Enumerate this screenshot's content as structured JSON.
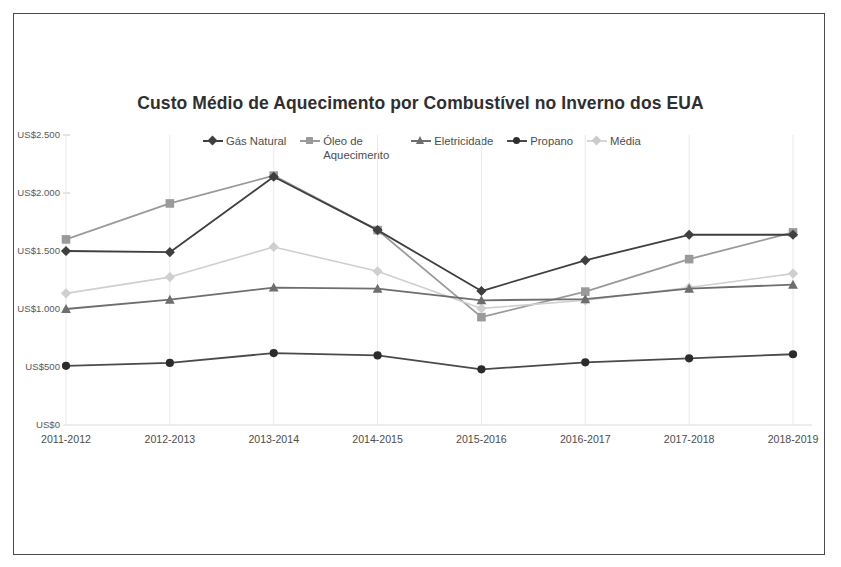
{
  "chart_data": {
    "type": "line",
    "title": "Custo Médio de Aquecimento por Combustível no Inverno dos EUA",
    "xlabel": "",
    "ylabel": "",
    "categories": [
      "2011-2012",
      "2012-2013",
      "2013-2014",
      "2014-2015",
      "2015-2016",
      "2016-2017",
      "2017-2018",
      "2018-2019"
    ],
    "ylim": [
      0,
      2500
    ],
    "ytick_values": [
      0,
      500,
      1000,
      1500,
      2000,
      2500
    ],
    "ytick_labels": [
      "US$0",
      "US$500",
      "US$1.000",
      "US$1.500",
      "US$2.000",
      "US$2.500"
    ],
    "grid": "vertical",
    "legend_position": "top",
    "series": [
      {
        "name": "Gás Natural",
        "marker": "diamond",
        "color": "#3f3f3f",
        "values": [
          1500,
          1490,
          2140,
          1680,
          1155,
          1420,
          1640,
          1640
        ]
      },
      {
        "name": "Óleo de Aquecimento",
        "marker": "square",
        "color": "#9a9a9a",
        "values": [
          1600,
          1910,
          2150,
          1680,
          930,
          1150,
          1430,
          1660
        ]
      },
      {
        "name": "Eletricidade",
        "marker": "triangle",
        "color": "#6e6e6e",
        "values": [
          1000,
          1080,
          1185,
          1175,
          1075,
          1085,
          1175,
          1210
        ]
      },
      {
        "name": "Propano",
        "marker": "circle",
        "color": "#4a4a4a",
        "values": [
          510,
          535,
          620,
          600,
          480,
          540,
          575,
          610
        ]
      },
      {
        "name": "Média",
        "marker": "diamond",
        "color": "#cfcfcf",
        "values": [
          1135,
          1275,
          1535,
          1325,
          1005,
          1075,
          1185,
          1305
        ]
      }
    ]
  },
  "chart": {
    "title": "Custo Médio de Aquecimento por Combustível no Inverno dos EUA",
    "legend": [
      {
        "label": "Gás Natural",
        "marker": "diamond-marker-icon",
        "color": "#3f3f3f"
      },
      {
        "label": "Óleo de Aquecimento",
        "marker": "square-marker-icon",
        "color": "#9a9a9a"
      },
      {
        "label": "Eletricidade",
        "marker": "triangle-marker-icon",
        "color": "#6e6e6e"
      },
      {
        "label": "Propano",
        "marker": "circle-marker-icon",
        "color": "#4a4a4a"
      },
      {
        "label": "Média",
        "marker": "diamond-marker-icon",
        "color": "#cfcfcf"
      }
    ],
    "y_labels": [
      "US$2.500",
      "US$2.000",
      "US$1.500",
      "US$1.000",
      "US$500",
      "US$0"
    ],
    "x_labels": [
      "2011-2012",
      "2012-2013",
      "2013-2014",
      "2014-2015",
      "2015-2016",
      "2016-2017",
      "2017-2018",
      "2018-2019"
    ]
  }
}
